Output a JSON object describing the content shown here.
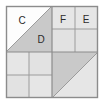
{
  "diagram": {
    "name": "quilt-block-diagram",
    "canvas": {
      "width": 104,
      "height": 104
    },
    "block": {
      "x": 6,
      "y": 6,
      "width": 92,
      "height": 92
    },
    "colors": {
      "background": "#ffffff",
      "outer_border": "#8c8c8c",
      "grid_line": "#8c8c8c",
      "sub_grid_line": "#b4b4b4",
      "white_patch": "#fdfdfd",
      "light_gray_patch": "#e3e3e3",
      "medium_gray_patch": "#c9c9c9",
      "label_text": "#2b2b2b"
    },
    "quadrants": [
      {
        "id": "top-left",
        "type": "half-square-triangle",
        "diagonal": "bottom-left-to-top-right",
        "patches": [
          {
            "id": "tl-upper",
            "label": "C",
            "fill": "white_patch"
          },
          {
            "id": "tl-lower",
            "label": "D",
            "fill": "medium_gray_patch"
          }
        ]
      },
      {
        "id": "top-right",
        "type": "four-patch",
        "patches": [
          {
            "id": "tr-1",
            "label": "F",
            "fill": "light_gray_patch"
          },
          {
            "id": "tr-2",
            "label": "E",
            "fill": "light_gray_patch"
          },
          {
            "id": "tr-3",
            "label": "",
            "fill": "light_gray_patch"
          },
          {
            "id": "tr-4",
            "label": "",
            "fill": "light_gray_patch"
          }
        ]
      },
      {
        "id": "bottom-left",
        "type": "four-patch",
        "patches": [
          {
            "id": "bl-1",
            "label": "",
            "fill": "light_gray_patch"
          },
          {
            "id": "bl-2",
            "label": "",
            "fill": "light_gray_patch"
          },
          {
            "id": "bl-3",
            "label": "",
            "fill": "light_gray_patch"
          },
          {
            "id": "bl-4",
            "label": "",
            "fill": "light_gray_patch"
          }
        ]
      },
      {
        "id": "bottom-right",
        "type": "half-square-triangle",
        "diagonal": "bottom-left-to-top-right",
        "patches": [
          {
            "id": "br-upper",
            "label": "",
            "fill": "medium_gray_patch"
          },
          {
            "id": "br-lower",
            "label": "",
            "fill": "light_gray_patch"
          }
        ]
      }
    ],
    "labels": [
      {
        "key": "C",
        "text": "C",
        "x": 22,
        "y": 21
      },
      {
        "key": "D",
        "text": "D",
        "x": 41,
        "y": 40
      },
      {
        "key": "F",
        "text": "F",
        "x": 63,
        "y": 20
      },
      {
        "key": "E",
        "text": "E",
        "x": 86,
        "y": 20
      }
    ]
  }
}
